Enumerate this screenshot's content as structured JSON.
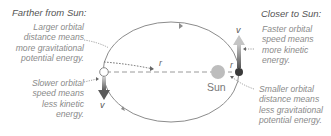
{
  "left": {
    "heading": "Farther from Sun:",
    "potential_note": [
      "Larger orbital",
      "distance means",
      "more gravitational",
      "potential energy."
    ],
    "kinetic_note": [
      "Slower orbital",
      "speed means",
      "less kinetic",
      "energy."
    ]
  },
  "right": {
    "heading": "Closer to Sun:",
    "kinetic_note": [
      "Faster orbital",
      "speed means",
      "more kinetic",
      "energy."
    ],
    "potential_note": [
      "Smaller orbital",
      "distance means",
      "less gravitational",
      "potential energy."
    ]
  },
  "diagram": {
    "sun_label": "Sun",
    "radius_label_far": "r",
    "radius_label_near": "r",
    "velocity_label_far": "v",
    "velocity_label_near": "v",
    "colors": {
      "orbit": "#8c8c8c",
      "sun": "#bdbdbd",
      "planet_near": "#3a3a3a",
      "planet_far": "#ffffff",
      "velocity_arrow": "#7a7a7a",
      "text": "#8a8a8a"
    }
  }
}
